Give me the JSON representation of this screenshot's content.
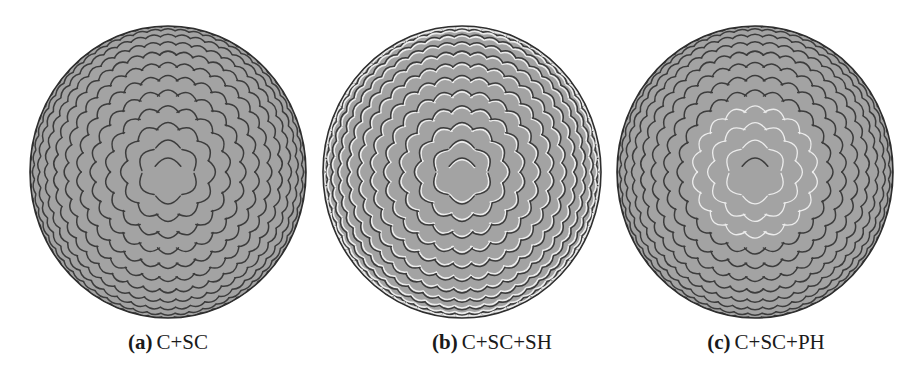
{
  "figure": {
    "colors": {
      "background": "#ffffff",
      "sphere_fill": "#a3a3a3",
      "sphere_outline": "#2e2e2e",
      "scale_shadow": "#3c3c3c",
      "scale_highlight": "#ececec"
    },
    "panels": [
      {
        "id": "a",
        "label": "(a)",
        "caption": "C+SC",
        "style": "dark-edges",
        "center_x": 167,
        "width": 276,
        "height": 292,
        "highlight_center": false
      },
      {
        "id": "b",
        "label": "(b)",
        "caption": "C+SC+SH",
        "style": "dark-and-light-edges",
        "center_x": 462,
        "width": 278,
        "height": 292,
        "highlight_center": false
      },
      {
        "id": "c",
        "label": "(c)",
        "caption": "C+SC+PH",
        "style": "dark-edges-with-center-highlights",
        "center_x": 755,
        "width": 276,
        "height": 292,
        "highlight_center": true
      }
    ]
  }
}
